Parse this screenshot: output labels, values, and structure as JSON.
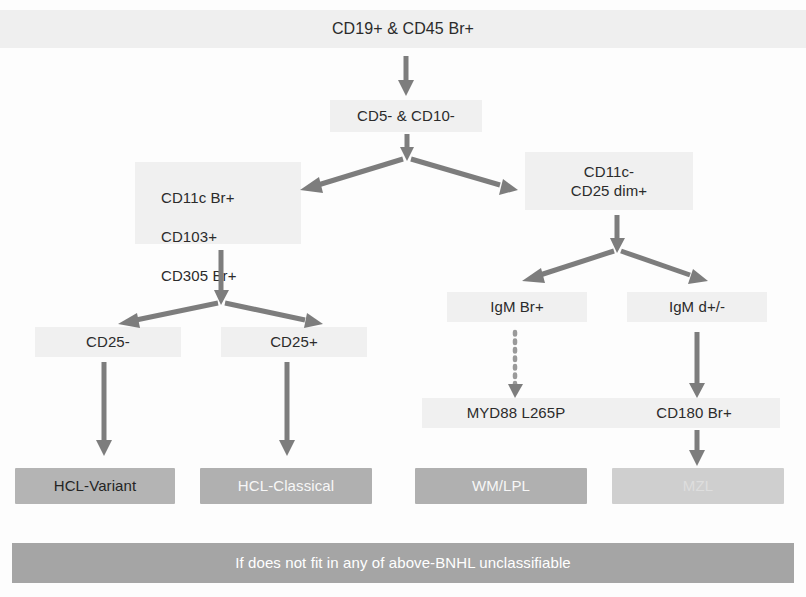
{
  "diagram": {
    "title_banner": "CD19+ & CD45 Br+",
    "nodes": {
      "root": "CD19+ & CD45 Br+",
      "cd5_cd10": "CD5- & CD10-",
      "left_panel_line1": "CD11c Br+",
      "left_panel_line2": "CD103+",
      "left_panel_line3": "CD305 Br+",
      "right_panel_line1": "CD11c-",
      "right_panel_line2": "CD25 dim+",
      "cd25_neg": "CD25-",
      "cd25_pos": "CD25+",
      "igm_br": "IgM Br+",
      "igm_d": "IgM d+/-",
      "myd88": "MYD88 L265P",
      "cd180": "CD180 Br+"
    },
    "outcomes": {
      "hcl_variant": "HCL-Variant",
      "hcl_classical": "HCL-Classical",
      "wm_lpl": "WM/LPL",
      "mzl": "MZL"
    },
    "footer": "If does not fit in any of above-BNHL unclassifiable",
    "colors": {
      "arrow": "#7d7d7d",
      "dotted_arrow": "#9a9a9a",
      "pale_plate": "#f0f0f0",
      "outcome_gray": "#b4b4b4",
      "outcome_faded": "#cfcfcf",
      "footer_gray": "#a5a5a5",
      "text_dark": "#2b2b2b",
      "text_light": "#ffffff"
    }
  }
}
